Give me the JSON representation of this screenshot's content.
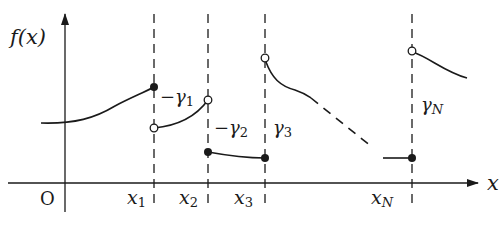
{
  "figure": {
    "y_axis_label": "f(x)",
    "x_axis_label": "x",
    "origin_label": "O",
    "x_ticks": [
      {
        "base": "x",
        "sub": "1"
      },
      {
        "base": "x",
        "sub": "2"
      },
      {
        "base": "x",
        "sub": "3"
      },
      {
        "base": "x",
        "sub": "N"
      }
    ],
    "jump_labels": [
      {
        "prefix": "−",
        "base": "γ",
        "sub": "1"
      },
      {
        "prefix": "−",
        "base": "γ",
        "sub": "2"
      },
      {
        "prefix": "",
        "base": "γ",
        "sub": "3"
      },
      {
        "prefix": "",
        "base": "γ",
        "sub": "N"
      }
    ],
    "colors": {
      "line": "#1a1a1a",
      "background": "#ffffff"
    }
  }
}
